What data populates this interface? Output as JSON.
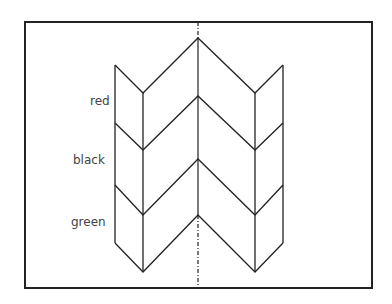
{
  "diagram": {
    "title": "",
    "type": "chevron-fold pattern",
    "labels": [
      {
        "text": "red",
        "x": 90,
        "y": 105
      },
      {
        "text": "black",
        "x": 95,
        "y": 164
      },
      {
        "text": "green",
        "x": 93,
        "y": 226
      }
    ],
    "colors": {
      "stroke": "#222222",
      "background": "#ffffff",
      "label": "#444444"
    }
  }
}
